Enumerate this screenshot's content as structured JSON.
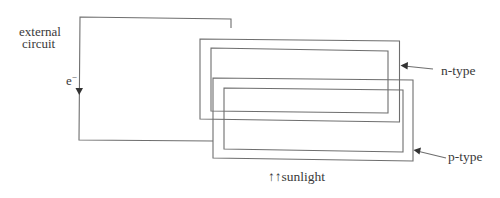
{
  "diagram": {
    "labels": {
      "external_line1": "external",
      "external_line2": "circuit",
      "electron": "e",
      "electron_sup": "−",
      "n_type": "n-type",
      "p_type": "p-type",
      "sunlight": "↑↑sunlight"
    },
    "colors": {
      "line": "#6e6e6e",
      "text": "#3a3a3a",
      "background": "#ffffff"
    },
    "components": [
      {
        "id": "external-circuit",
        "kind": "wire-loop"
      },
      {
        "id": "n-type-layer",
        "kind": "double-rectangle",
        "label": "n-type"
      },
      {
        "id": "p-type-layer",
        "kind": "double-rectangle",
        "label": "p-type"
      },
      {
        "id": "electron-flow-arrow",
        "kind": "arrow",
        "direction": "down",
        "label": "e−"
      },
      {
        "id": "sunlight-arrows",
        "kind": "arrows",
        "direction": "up",
        "label": "sunlight"
      }
    ]
  }
}
